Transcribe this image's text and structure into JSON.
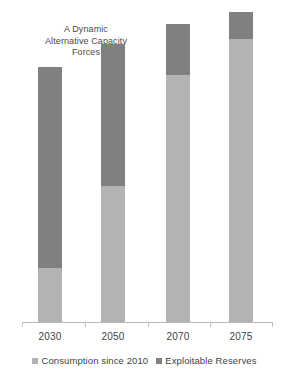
{
  "chart_data": {
    "type": "bar",
    "subtype": "stacked-bar",
    "title": "A Dynamic Alternative Capacity Forces",
    "title_lines": [
      "A Dynamic",
      "Alternative Capacity",
      "Forces"
    ],
    "xlabel": "",
    "ylabel": "",
    "categories": [
      "2030",
      "2050",
      "2070",
      "2075"
    ],
    "series": [
      {
        "name": "Consumption since 2010",
        "color": "#b3b3b3",
        "values": [
          32,
          80,
          145,
          166
        ]
      },
      {
        "name": "Exploitable Reserves",
        "color": "#808080",
        "values": [
          118,
          83,
          30,
          16
        ]
      }
    ],
    "totals": [
      150,
      163,
      175,
      182
    ],
    "ylim": [
      0,
      200
    ],
    "grid": false,
    "legend_position": "bottom",
    "axis_line_color": "#b9b9b9"
  },
  "chart": {
    "title_lines": [
      "A Dynamic",
      "Alternative Capacity",
      "Forces"
    ],
    "x_labels": [
      "2030",
      "2050",
      "2070",
      "2075"
    ],
    "legend": [
      {
        "label": "Consumption since 2010",
        "color": "#b3b3b3"
      },
      {
        "label": "Exploitable Reserves",
        "color": "#808080"
      }
    ]
  }
}
